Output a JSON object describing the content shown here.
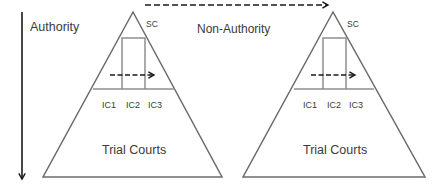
{
  "diagram": {
    "type": "court-hierarchy",
    "axis": {
      "label": "Authority",
      "direction": "down"
    },
    "cross_label": "Non-Authority",
    "colors": {
      "outline": "#6b6b6b",
      "inner_lines": "#8e8e8e",
      "arrows": "#1a1a1a",
      "text": "#3a3a3a",
      "background": "#ffffff"
    },
    "pyramids": [
      {
        "top_label": "SC",
        "intermediate_labels": [
          "IC1",
          "IC2",
          "IC3"
        ],
        "base_label": "Trial Courts"
      },
      {
        "top_label": "SC",
        "intermediate_labels": [
          "IC1",
          "IC2",
          "IC3"
        ],
        "base_label": "Trial Courts"
      }
    ],
    "edges": [
      {
        "from": "left.SC",
        "to": "right.SC",
        "style": "dashed",
        "label": "Non-Authority"
      },
      {
        "from": "left.IC1",
        "to": "left.IC3",
        "style": "dashed"
      },
      {
        "from": "right.IC1",
        "to": "right.IC3",
        "style": "dashed"
      }
    ]
  }
}
